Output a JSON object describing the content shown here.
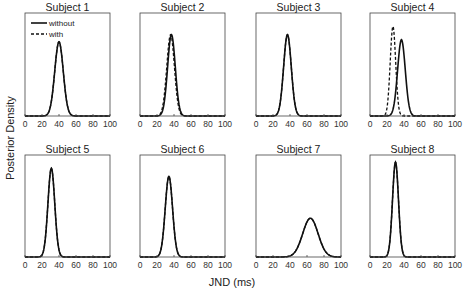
{
  "figure": {
    "ylabel": "Posterior Density",
    "xlabel": "JND (ms)",
    "legend": {
      "solid": "without",
      "dashed": "with"
    }
  },
  "chart_data": {
    "type": "line",
    "layout": "2x4 small multiples",
    "xlabel": "JND (ms)",
    "ylabel": "Posterior Density",
    "xlim": [
      0,
      100
    ],
    "xticks": [
      0,
      20,
      40,
      60,
      80,
      100
    ],
    "yticks": [],
    "grid": false,
    "legend": {
      "position": "upper-left of Subject 1",
      "entries": [
        "without",
        "with"
      ]
    },
    "panels": [
      {
        "title": "Subject 1",
        "series": [
          {
            "name": "without",
            "style": "solid",
            "mean": 40,
            "sd": 5.0,
            "peak": 0.72
          },
          {
            "name": "with",
            "style": "dashed",
            "mean": 40,
            "sd": 5.0,
            "peak": 0.72
          }
        ]
      },
      {
        "title": "Subject 2",
        "series": [
          {
            "name": "without",
            "style": "solid",
            "mean": 37,
            "sd": 4.5,
            "peak": 0.79
          },
          {
            "name": "with",
            "style": "dashed",
            "mean": 36,
            "sd": 4.5,
            "peak": 0.79
          }
        ]
      },
      {
        "title": "Subject 3",
        "series": [
          {
            "name": "without",
            "style": "solid",
            "mean": 37,
            "sd": 4.5,
            "peak": 0.79
          },
          {
            "name": "with",
            "style": "dashed",
            "mean": 37,
            "sd": 4.5,
            "peak": 0.79
          }
        ]
      },
      {
        "title": "Subject 4",
        "series": [
          {
            "name": "without",
            "style": "solid",
            "mean": 37,
            "sd": 4.5,
            "peak": 0.74
          },
          {
            "name": "with",
            "style": "dashed",
            "mean": 27,
            "sd": 3.2,
            "peak": 0.87
          }
        ]
      },
      {
        "title": "Subject 5",
        "series": [
          {
            "name": "without",
            "style": "solid",
            "mean": 31,
            "sd": 4.0,
            "peak": 0.87
          },
          {
            "name": "with",
            "style": "dashed",
            "mean": 31,
            "sd": 4.0,
            "peak": 0.87
          }
        ]
      },
      {
        "title": "Subject 6",
        "series": [
          {
            "name": "without",
            "style": "solid",
            "mean": 34,
            "sd": 4.3,
            "peak": 0.79
          },
          {
            "name": "with",
            "style": "dashed",
            "mean": 34,
            "sd": 4.3,
            "peak": 0.79
          }
        ]
      },
      {
        "title": "Subject 7",
        "series": [
          {
            "name": "without",
            "style": "solid",
            "mean": 64,
            "sd": 9.0,
            "peak": 0.38
          },
          {
            "name": "with",
            "style": "dashed",
            "mean": 64,
            "sd": 9.0,
            "peak": 0.38
          }
        ]
      },
      {
        "title": "Subject 8",
        "series": [
          {
            "name": "without",
            "style": "solid",
            "mean": 30,
            "sd": 3.5,
            "peak": 0.93
          },
          {
            "name": "with",
            "style": "dashed",
            "mean": 30,
            "sd": 3.5,
            "peak": 0.93
          }
        ]
      }
    ]
  }
}
